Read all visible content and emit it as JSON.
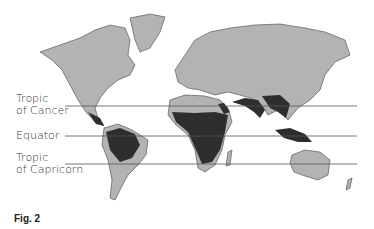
{
  "labels": {
    "tropic_cancer": [
      "Tropic",
      "of Cancer"
    ],
    "equator": "Equator",
    "tropic_capricorn": [
      "Tropic",
      "of Capricorn"
    ]
  },
  "caption": "Fig. 2",
  "colors": {
    "land": "#b3b3b3",
    "tropical_region": "#2e2e2e",
    "outline": "#444444",
    "lines": "#555555"
  }
}
